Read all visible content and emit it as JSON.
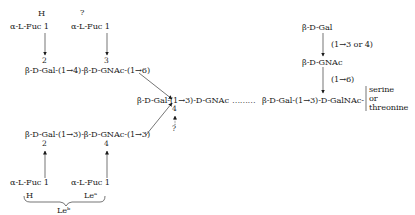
{
  "diagram": {
    "type": "glycan-structure",
    "top_left": {
      "antigen_label": "H",
      "fucose": "α-L-Fuc 1",
      "link_position": "2"
    },
    "top_middle": {
      "antigen_label": "?",
      "fucose": "α-L-Fuc 1",
      "link_position": "3"
    },
    "upper_chain": "β-D-Gal-(1→4)-β-D-GNAc-(1→6)",
    "core_chain": "β-D-Gal-(1→3)-D-GNAc",
    "core_dots": "………",
    "core_branch_position": "4",
    "core_branch_unknown": "?",
    "lower_chain": "β-D-Gal-(1→3)-β-D-GNAc-(1→3)",
    "bottom_left": {
      "link_position": "2",
      "fucose": "α-L-Fuc 1",
      "antigen_label": "H"
    },
    "bottom_middle": {
      "link_position": "4",
      "fucose": "α-L-Fuc 1",
      "antigen_label": "Leᵃ"
    },
    "brace_label": "Leᵇ",
    "right_branch": {
      "top_sugar": "β-D-Gal",
      "top_linkage": "(1→3 or 4)",
      "middle_sugar": "β-D-GNAc",
      "middle_linkage": "(1→6)",
      "main_chain": "β-D-Gal-(1→3)-D-GalNAc-",
      "attachment": [
        "serine",
        "or",
        "threonine"
      ]
    }
  }
}
